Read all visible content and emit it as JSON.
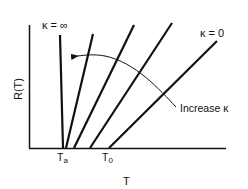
{
  "diagram": {
    "title": "",
    "y_axis_label": "R(T)",
    "x_axis_label": "T",
    "x_ticks": [
      {
        "label": "T",
        "sub": "a",
        "x": 65
      },
      {
        "label": "T",
        "sub": "0",
        "x": 110
      }
    ],
    "curve_labels": {
      "top_left": "κ = ∞",
      "top_right": "κ = 0"
    },
    "annotation": "Increase κ",
    "lines": [
      {
        "name": "kappa-infinity",
        "x1": 60,
        "y1": 35,
        "x2": 63,
        "y2": 148
      },
      {
        "name": "kappa-mid-1",
        "x1": 93,
        "y1": 34,
        "x2": 66,
        "y2": 148
      },
      {
        "name": "kappa-mid-2",
        "x1": 134,
        "y1": 25,
        "x2": 74,
        "y2": 148
      },
      {
        "name": "kappa-mid-3",
        "x1": 172,
        "y1": 23,
        "x2": 90,
        "y2": 148
      },
      {
        "name": "kappa-zero",
        "x1": 217,
        "y1": 41,
        "x2": 109,
        "y2": 148
      }
    ],
    "color": "#111111"
  }
}
